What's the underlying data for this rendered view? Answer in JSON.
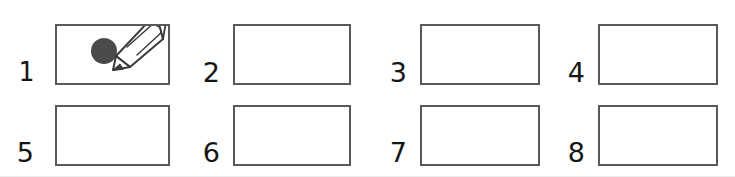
{
  "worksheet": {
    "title": "Numbered blank drawing boxes worksheet",
    "rows": 2,
    "columns": 4,
    "background_color": "#ffffff",
    "box_border_color": "#58595b",
    "number_color": "#161616"
  },
  "cells": [
    {
      "number": "1",
      "label": "box-1",
      "filled": true,
      "content_icon": "pencil-drawing-dot-icon",
      "content_description": "Pencil drawing a filled dark gray dot",
      "dot_color": "#4a4a4a",
      "pencil_outline_color": "#3a3a3a",
      "pencil_body_color": "#ffffff"
    },
    {
      "number": "2",
      "label": "box-2",
      "filled": false,
      "content_icon": "",
      "content_description": ""
    },
    {
      "number": "3",
      "label": "box-3",
      "filled": false,
      "content_icon": "",
      "content_description": ""
    },
    {
      "number": "4",
      "label": "box-4",
      "filled": false,
      "content_icon": "",
      "content_description": ""
    },
    {
      "number": "5",
      "label": "box-5",
      "filled": false,
      "content_icon": "",
      "content_description": ""
    },
    {
      "number": "6",
      "label": "box-6",
      "filled": false,
      "content_icon": "",
      "content_description": ""
    },
    {
      "number": "7",
      "label": "box-7",
      "filled": false,
      "content_icon": "",
      "content_description": ""
    },
    {
      "number": "8",
      "label": "box-8",
      "filled": false,
      "content_icon": "",
      "content_description": ""
    }
  ]
}
